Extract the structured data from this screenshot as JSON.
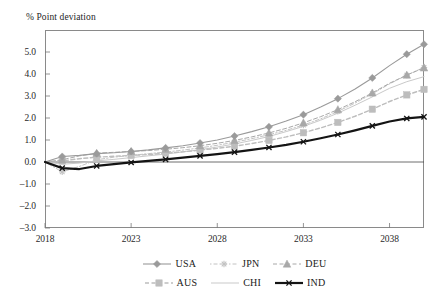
{
  "chart_data": {
    "type": "line",
    "title": "",
    "ylabel": "% Point deviation",
    "xlabel": "",
    "ylim": [
      -3.0,
      6.0
    ],
    "xlim": [
      2018,
      2040
    ],
    "grid": false,
    "legend_position": "bottom",
    "y_ticks": [
      "5.0",
      "4.0",
      "3.0",
      "2.0",
      "1.0",
      "0.0",
      "-1.0",
      "-2.0",
      "-3.0"
    ],
    "y_tick_values": [
      5.0,
      4.0,
      3.0,
      2.0,
      1.0,
      0.0,
      -1.0,
      -2.0,
      -3.0
    ],
    "x_ticks": [
      "2018",
      "2023",
      "2028",
      "2033",
      "2038"
    ],
    "x_tick_values": [
      2018,
      2023,
      2028,
      2033,
      2038
    ],
    "x": [
      2018,
      2019,
      2020,
      2021,
      2022,
      2023,
      2024,
      2025,
      2026,
      2027,
      2028,
      2029,
      2030,
      2031,
      2032,
      2033,
      2034,
      2035,
      2036,
      2037,
      2038,
      2039,
      2040
    ],
    "series": [
      {
        "name": "USA",
        "color": "#9a9a9a",
        "marker": "diamond",
        "dash": "solid",
        "width": 1.1,
        "values": [
          0.0,
          0.25,
          0.3,
          0.38,
          0.42,
          0.48,
          0.55,
          0.64,
          0.74,
          0.86,
          1.0,
          1.18,
          1.38,
          1.6,
          1.86,
          2.15,
          2.5,
          2.88,
          3.32,
          3.82,
          4.38,
          4.9,
          5.35
        ]
      },
      {
        "name": "JPN",
        "color": "#c2c2c2",
        "marker": "star",
        "dash": "dashdot",
        "width": 1.0,
        "values": [
          0.0,
          -0.45,
          -0.2,
          0.1,
          0.22,
          0.3,
          0.38,
          0.45,
          0.54,
          0.64,
          0.76,
          0.9,
          1.06,
          1.24,
          1.44,
          1.68,
          1.96,
          2.3,
          2.68,
          3.1,
          3.55,
          3.95,
          4.3
        ]
      },
      {
        "name": "DEU",
        "color": "#a8a8a8",
        "marker": "triangle",
        "dash": "dashed",
        "width": 1.0,
        "values": [
          0.0,
          0.1,
          0.28,
          0.4,
          0.44,
          0.48,
          0.52,
          0.58,
          0.65,
          0.74,
          0.85,
          0.98,
          1.14,
          1.32,
          1.53,
          1.78,
          2.06,
          2.38,
          2.74,
          3.14,
          3.58,
          3.95,
          4.28
        ]
      },
      {
        "name": "AUS",
        "color": "#bdbdbd",
        "marker": "square",
        "dash": "dashed",
        "width": 1.4,
        "values": [
          0.0,
          0.05,
          0.15,
          0.22,
          0.26,
          0.3,
          0.34,
          0.4,
          0.46,
          0.54,
          0.62,
          0.72,
          0.84,
          0.98,
          1.14,
          1.33,
          1.55,
          1.8,
          2.08,
          2.4,
          2.75,
          3.05,
          3.3
        ]
      },
      {
        "name": "CHI",
        "color": "#c9c9c9",
        "marker": "none",
        "dash": "solid",
        "width": 1.0,
        "values": [
          0.0,
          -0.1,
          -0.05,
          0.05,
          0.12,
          0.2,
          0.28,
          0.36,
          0.46,
          0.56,
          0.68,
          0.82,
          0.98,
          1.16,
          1.38,
          1.62,
          1.9,
          2.22,
          2.58,
          2.96,
          3.35,
          3.65,
          3.88
        ]
      },
      {
        "name": "IND",
        "color": "#141414",
        "marker": "x",
        "dash": "solid",
        "width": 2.2,
        "values": [
          0.0,
          -0.28,
          -0.32,
          -0.18,
          -0.1,
          -0.02,
          0.05,
          0.12,
          0.2,
          0.28,
          0.36,
          0.45,
          0.55,
          0.66,
          0.78,
          0.92,
          1.08,
          1.25,
          1.44,
          1.64,
          1.84,
          1.98,
          2.05
        ]
      }
    ]
  },
  "legend": {
    "rows": [
      [
        {
          "label": "USA"
        },
        {
          "label": "JPN"
        },
        {
          "label": "DEU"
        }
      ],
      [
        {
          "label": "AUS"
        },
        {
          "label": "CHI"
        },
        {
          "label": "IND"
        }
      ]
    ]
  }
}
